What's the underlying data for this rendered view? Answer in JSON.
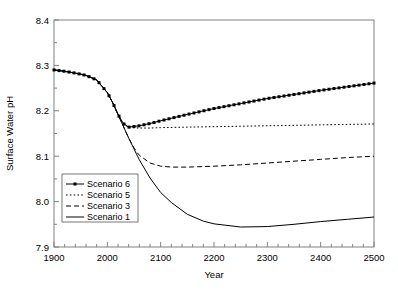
{
  "chart_data": {
    "type": "line",
    "title": "",
    "xlabel": "Year",
    "ylabel": "Surface Water pH",
    "xlim": [
      1900,
      2500
    ],
    "ylim": [
      7.9,
      8.4
    ],
    "xticks": [
      1900,
      2000,
      2100,
      2200,
      2300,
      2400,
      2500
    ],
    "yticks": [
      "7.9",
      "8.0",
      "8.1",
      "8.2",
      "8.3",
      "8.4"
    ],
    "x_minor_tick_interval": 20,
    "y_minor_tick_interval": 0.05,
    "grid": false,
    "legend_position": "lower-left-inside",
    "series": [
      {
        "name": "Scenario 6",
        "style": "line-with-square-markers",
        "x": [
          1900,
          1920,
          1940,
          1960,
          1980,
          2000,
          2010,
          2020,
          2030,
          2040,
          2060,
          2080,
          2100,
          2150,
          2200,
          2250,
          2300,
          2350,
          2400,
          2450,
          2500
        ],
        "values": [
          8.29,
          8.287,
          8.283,
          8.278,
          8.268,
          8.24,
          8.218,
          8.192,
          8.172,
          8.164,
          8.167,
          8.172,
          8.178,
          8.192,
          8.205,
          8.216,
          8.227,
          8.236,
          8.245,
          8.253,
          8.261
        ]
      },
      {
        "name": "Scenario 5",
        "style": "dotted",
        "x": [
          1900,
          1920,
          1940,
          1960,
          1980,
          2000,
          2010,
          2020,
          2030,
          2040,
          2060,
          2080,
          2100,
          2150,
          2200,
          2250,
          2300,
          2350,
          2400,
          2450,
          2500
        ],
        "values": [
          8.29,
          8.287,
          8.283,
          8.278,
          8.268,
          8.24,
          8.218,
          8.192,
          8.172,
          8.163,
          8.162,
          8.162,
          8.163,
          8.164,
          8.165,
          8.166,
          8.167,
          8.168,
          8.169,
          8.17,
          8.171
        ]
      },
      {
        "name": "Scenario 3",
        "style": "dashed",
        "x": [
          1900,
          1920,
          1940,
          1960,
          1980,
          2000,
          2010,
          2020,
          2030,
          2040,
          2050,
          2060,
          2080,
          2100,
          2120,
          2150,
          2200,
          2250,
          2300,
          2350,
          2400,
          2450,
          2500
        ],
        "values": [
          8.29,
          8.287,
          8.283,
          8.278,
          8.268,
          8.24,
          8.218,
          8.192,
          8.166,
          8.14,
          8.118,
          8.102,
          8.085,
          8.078,
          8.076,
          8.076,
          8.078,
          8.081,
          8.085,
          8.089,
          8.093,
          8.097,
          8.1
        ]
      },
      {
        "name": "Scenario 1",
        "style": "solid",
        "x": [
          1900,
          1920,
          1940,
          1960,
          1980,
          2000,
          2010,
          2020,
          2030,
          2040,
          2060,
          2080,
          2100,
          2120,
          2150,
          2180,
          2200,
          2250,
          2300,
          2350,
          2400,
          2450,
          2500
        ],
        "values": [
          8.29,
          8.287,
          8.283,
          8.278,
          8.268,
          8.24,
          8.218,
          8.192,
          8.166,
          8.14,
          8.092,
          8.052,
          8.02,
          7.998,
          7.972,
          7.957,
          7.951,
          7.944,
          7.945,
          7.95,
          7.956,
          7.961,
          7.966
        ]
      }
    ],
    "legend_entries": [
      {
        "label": "Scenario 6",
        "style": "line-with-square-markers"
      },
      {
        "label": "Scenario 5",
        "style": "dotted"
      },
      {
        "label": "Scenario 3",
        "style": "dashed"
      },
      {
        "label": "Scenario 1",
        "style": "solid"
      }
    ]
  },
  "colors": {
    "line": "#000000",
    "axis": "#808080",
    "background": "#ffffff"
  }
}
